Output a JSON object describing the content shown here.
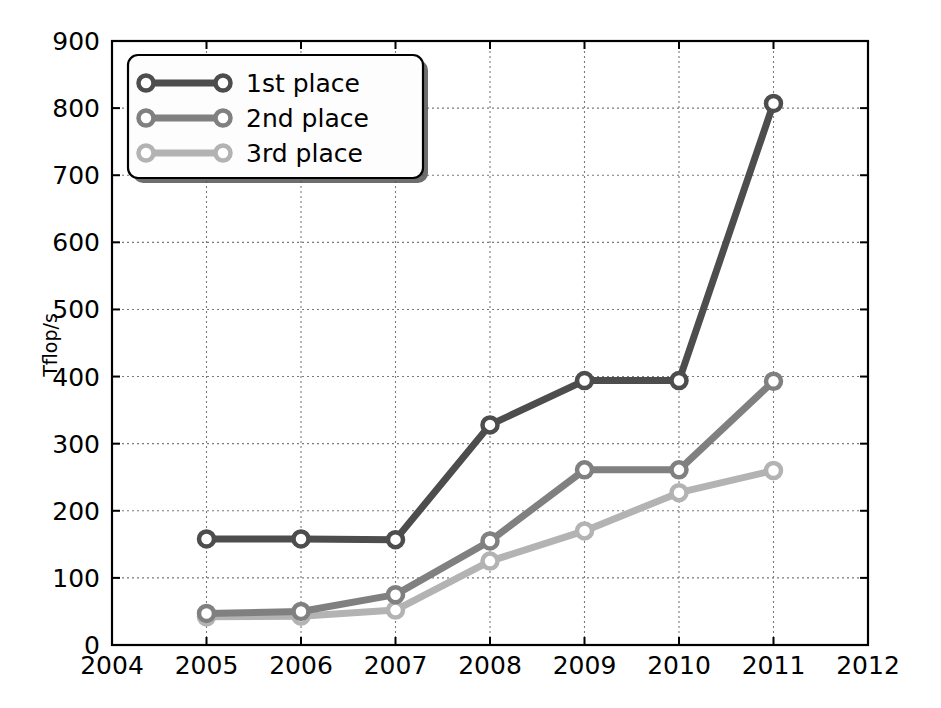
{
  "chart_data": {
    "type": "line",
    "title": "",
    "xlabel": "",
    "ylabel": "Tflop/s",
    "x": [
      2005,
      2006,
      2007,
      2008,
      2009,
      2010,
      2011
    ],
    "xlim": [
      2004,
      2012
    ],
    "ylim": [
      0,
      900
    ],
    "xticks": [
      2004,
      2005,
      2006,
      2007,
      2008,
      2009,
      2010,
      2011,
      2012
    ],
    "xtick_labels": [
      "2004",
      "2005",
      "2006",
      "2007",
      "2008",
      "2009",
      "2010",
      "2011",
      "2012"
    ],
    "yticks": [
      0,
      100,
      200,
      300,
      400,
      500,
      600,
      700,
      800,
      900
    ],
    "ytick_labels": [
      "0",
      "100",
      "200",
      "300",
      "400",
      "500",
      "600",
      "700",
      "800",
      "900"
    ],
    "grid": true,
    "legend_position": "upper left",
    "marker": "circle",
    "series": [
      {
        "name": "1st place",
        "color": "#4d4d4d",
        "values": [
          158,
          158,
          157,
          328,
          394,
          394,
          807
        ]
      },
      {
        "name": "2nd place",
        "color": "#808080",
        "values": [
          47,
          50,
          75,
          155,
          261,
          261,
          393
        ]
      },
      {
        "name": "3rd place",
        "color": "#b3b3b3",
        "values": [
          42,
          43,
          52,
          125,
          170,
          227,
          260
        ]
      }
    ]
  },
  "axes": {
    "ylabel": "Tflop/s"
  },
  "legend": {
    "entries": [
      {
        "label": "1st place"
      },
      {
        "label": "2nd place"
      },
      {
        "label": "3rd place"
      }
    ]
  }
}
